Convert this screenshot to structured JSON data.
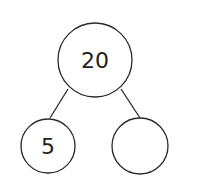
{
  "diagram": {
    "type": "number-bond",
    "whole": "20",
    "parts": [
      "5",
      ""
    ],
    "stroke_color": "#2a2a2a"
  }
}
